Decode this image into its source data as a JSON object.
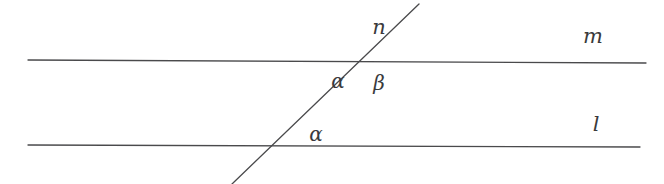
{
  "figure": {
    "kind": "transversal-cutting-two-parallel-lines",
    "background_color": "#ffffff",
    "stroke_color": "#4a4a4c",
    "label_color": "#3a3a3c",
    "stroke_width": 1.3,
    "width": 664,
    "height": 184
  },
  "lines": {
    "m": {
      "label": "m",
      "x1": 28,
      "y1": 60,
      "x2": 646,
      "y2": 63,
      "label_x": 593,
      "label_y": 36
    },
    "l": {
      "label": "l",
      "x1": 28,
      "y1": 145,
      "x2": 640,
      "y2": 147,
      "label_x": 596,
      "label_y": 124
    },
    "n": {
      "label": "n",
      "x1": 232,
      "y1": 184,
      "x2": 419,
      "y2": 4,
      "label_x": 379,
      "label_y": 27
    }
  },
  "intersections": {
    "upper": {
      "x": 364,
      "y": 62
    },
    "lower": {
      "x": 293,
      "y": 147
    }
  },
  "angles": [
    {
      "id": "alpha-upper",
      "label": "α",
      "x": 338,
      "y": 81
    },
    {
      "id": "beta-upper",
      "label": "β",
      "x": 379,
      "y": 83
    },
    {
      "id": "alpha-lower",
      "label": "α",
      "x": 316,
      "y": 134
    }
  ]
}
